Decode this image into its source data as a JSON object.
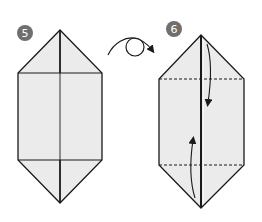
{
  "diagram": {
    "type": "origami-instructions",
    "colors": {
      "paper": "#ebebeb",
      "line": "#1a1a1a",
      "badge": "#6f6f6f",
      "badge_text": "#ffffff"
    },
    "steps": [
      {
        "number": "5",
        "description": "Hexagonal folded paper shape with center vertical line"
      },
      {
        "number": "6",
        "description": "Fold top and bottom triangles inward along dashed valley lines",
        "fold_lines": [
          "top-dashed-valley-fold",
          "bottom-dashed-valley-fold"
        ],
        "arrows": [
          "fold-down-arrow",
          "fold-up-arrow"
        ]
      }
    ],
    "transition": {
      "icon": "turn-over-arrow",
      "meaning": "Turn the model over"
    }
  }
}
